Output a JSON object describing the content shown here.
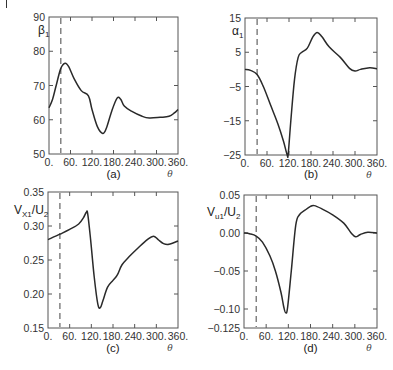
{
  "figure": {
    "x_axis_symbol": "θ",
    "xticks": [
      0,
      60,
      120,
      180,
      240,
      300,
      360
    ],
    "xtick_labels": [
      "0.",
      "60.",
      "120.",
      "180.",
      "240.",
      "300.",
      "360."
    ],
    "dashed_line_theta": 33
  },
  "chart_data": [
    {
      "type": "line",
      "panel": "(a)",
      "title": "",
      "xlabel": "θ",
      "ylabel": "β1",
      "ylabel_main": "β",
      "ylabel_sub": "1",
      "xlim": [
        0,
        360
      ],
      "ylim": [
        50,
        90
      ],
      "yticks": [
        50,
        60,
        70,
        80,
        90
      ],
      "ytick_labels": [
        "50",
        "60",
        "70",
        "80",
        "90"
      ],
      "grid": false,
      "x": [
        0,
        10,
        20,
        33,
        45,
        55,
        70,
        90,
        110,
        120,
        135,
        150,
        160,
        175,
        190,
        200,
        210,
        230,
        260,
        280,
        310,
        335,
        350,
        360
      ],
      "y": [
        63.5,
        66,
        70,
        75,
        76.5,
        75.5,
        72,
        68.5,
        67,
        63,
        58,
        56,
        57.5,
        62.5,
        66.3,
        66,
        64,
        62.5,
        61,
        60.5,
        60.7,
        61,
        62,
        63
      ]
    },
    {
      "type": "line",
      "panel": "(b)",
      "title": "",
      "xlabel": "θ",
      "ylabel": "α1",
      "ylabel_main": "α",
      "ylabel_sub": "1",
      "xlim": [
        0,
        360
      ],
      "ylim": [
        -25,
        15
      ],
      "yticks": [
        -25,
        -15,
        -5,
        5,
        15
      ],
      "ytick_labels": [
        "−25",
        "−15",
        "−5",
        "5",
        "15"
      ],
      "grid": false,
      "x": [
        0,
        15,
        33,
        50,
        70,
        90,
        105,
        115,
        118,
        125,
        135,
        145,
        155,
        170,
        185,
        197,
        210,
        230,
        260,
        285,
        300,
        315,
        340,
        360
      ],
      "y": [
        0,
        -0.3,
        -1.5,
        -5,
        -10.5,
        -16,
        -21,
        -25,
        -24.5,
        -15,
        -3,
        3.5,
        5,
        6.2,
        9.5,
        10.8,
        9.5,
        6.5,
        3.5,
        0.3,
        -0.5,
        0,
        0.5,
        0.2
      ]
    },
    {
      "type": "line",
      "panel": "(c)",
      "title": "",
      "xlabel": "θ",
      "ylabel": "VX1/U2",
      "ylabel_main": "V",
      "ylabel_sub": "X1",
      "ylabel_rest": "/U",
      "ylabel_sub2": "2",
      "xlim": [
        0,
        360
      ],
      "ylim": [
        0.15,
        0.35
      ],
      "yticks": [
        0.15,
        0.2,
        0.25,
        0.3,
        0.35
      ],
      "ytick_labels": [
        "0.15",
        "0.20",
        "0.25",
        "0.30",
        "0.35"
      ],
      "grid": false,
      "x": [
        0,
        33,
        60,
        85,
        98,
        106,
        110,
        118,
        128,
        138,
        145,
        152,
        165,
        180,
        192,
        205,
        225,
        250,
        275,
        292,
        305,
        320,
        335,
        360
      ],
      "y": [
        0.28,
        0.288,
        0.295,
        0.303,
        0.312,
        0.32,
        0.318,
        0.28,
        0.225,
        0.185,
        0.18,
        0.19,
        0.21,
        0.22,
        0.228,
        0.243,
        0.255,
        0.268,
        0.28,
        0.285,
        0.28,
        0.274,
        0.273,
        0.278
      ]
    },
    {
      "type": "line",
      "panel": "(d)",
      "title": "",
      "xlabel": "θ",
      "ylabel": "Vu1/U2",
      "ylabel_main": "V",
      "ylabel_sub": "u1",
      "ylabel_rest": "/U",
      "ylabel_sub2": "2",
      "xlim": [
        0,
        360
      ],
      "ylim": [
        -0.125,
        0.05
      ],
      "yticks": [
        -0.125,
        -0.1,
        -0.05,
        0.0,
        0.05
      ],
      "ytick_labels": [
        "−0.125",
        "−0.10",
        "−0.05",
        "0.00",
        "0.05"
      ],
      "grid": false,
      "x": [
        0,
        15,
        33,
        50,
        70,
        85,
        100,
        108,
        113,
        118,
        128,
        140,
        150,
        165,
        180,
        190,
        210,
        240,
        270,
        290,
        302,
        315,
        335,
        360
      ],
      "y": [
        0,
        -0.001,
        -0.004,
        -0.012,
        -0.03,
        -0.05,
        -0.078,
        -0.098,
        -0.105,
        -0.098,
        -0.05,
        0.01,
        0.024,
        0.03,
        0.035,
        0.036,
        0.032,
        0.024,
        0.013,
        0.0,
        -0.005,
        -0.002,
        0.001,
        0.0
      ]
    }
  ],
  "panels_layout": [
    {
      "left": 49,
      "top": 17,
      "right": 178,
      "bottom": 154,
      "label_y": 178,
      "ylabel_x": 38,
      "ylabel_y": 34
    },
    {
      "left": 245,
      "top": 18,
      "right": 377,
      "bottom": 155,
      "label_y": 178,
      "ylabel_x": 232,
      "ylabel_y": 35
    },
    {
      "left": 48,
      "top": 192,
      "right": 178,
      "bottom": 328,
      "label_y": 352,
      "ylabel_x": 14,
      "ylabel_y": 214
    },
    {
      "left": 244,
      "top": 195,
      "right": 377,
      "bottom": 328,
      "label_y": 352,
      "ylabel_x": 207,
      "ylabel_y": 216
    }
  ],
  "colors": {
    "line": "#2a2a2a",
    "axis": "#555555",
    "dashed": "#555555",
    "text": "#333333"
  }
}
